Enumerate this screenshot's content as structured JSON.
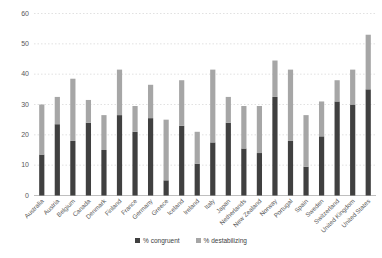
{
  "chart_data": {
    "type": "bar",
    "stacked": true,
    "title": "",
    "xlabel": "",
    "ylabel": "",
    "categories": [
      "Australia",
      "Austria",
      "Belgium",
      "Canada",
      "Denmark",
      "Finland",
      "France",
      "Germany",
      "Greece",
      "Iceland",
      "Ireland",
      "Italy",
      "Japan",
      "Netherlands",
      "New Zealand",
      "Norway",
      "Portugal",
      "Spain",
      "Sweden",
      "Switzerland",
      "United Kingdom",
      "United States"
    ],
    "series": [
      {
        "name": "% congruent",
        "color": "#404040",
        "values": [
          13.5,
          23.5,
          18,
          24,
          15,
          26.5,
          21,
          25.5,
          5,
          23,
          10.5,
          17.5,
          24,
          15.5,
          14,
          32.5,
          18,
          9.5,
          19.5,
          31,
          30,
          35
        ]
      },
      {
        "name": "% destabilizing",
        "color": "#a6a6a6",
        "values": [
          16.5,
          9,
          20.5,
          7.5,
          11.5,
          15,
          8.5,
          11,
          20,
          15,
          10.5,
          24,
          8.5,
          14,
          15.5,
          12,
          23.5,
          17,
          11.5,
          7,
          11.5,
          18
        ]
      }
    ],
    "ylim": [
      0,
      60
    ],
    "yticks": [
      0,
      10,
      20,
      30,
      40,
      50,
      60
    ],
    "grid": "horizontal-dotted",
    "gridline_color": "#d9d9d9",
    "axis_line_color": "#bfbfbf",
    "tick_label_color": "#595959",
    "x_label_rotation": -45,
    "legend_position": "bottom-center"
  }
}
